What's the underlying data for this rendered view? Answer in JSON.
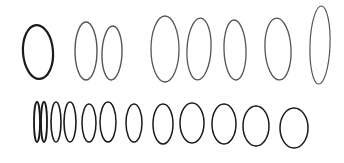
{
  "colors": {
    "background": "#ffffff",
    "ink_dark": "#1a1a1a",
    "ink_light": "#555555"
  },
  "rows": [
    {
      "name": "top-row",
      "count": 8
    },
    {
      "name": "bottom-row",
      "count": 12
    }
  ]
}
